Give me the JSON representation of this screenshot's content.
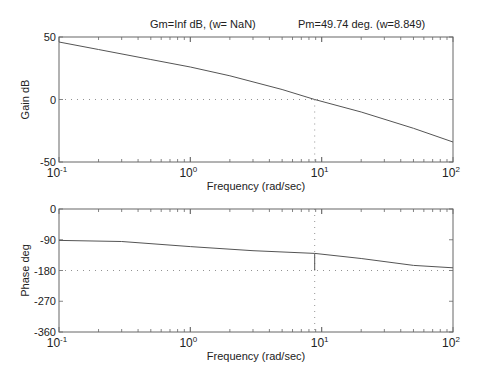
{
  "chart_data": [
    {
      "type": "line",
      "title": "Gm=Inf dB, (w= NaN)     Pm=49.74 deg. (w=8.849)",
      "xlabel": "Frequency (rad/sec)",
      "ylabel": "Gain dB",
      "xscale": "log",
      "xlim": [
        0.1,
        100
      ],
      "ylim": [
        -50,
        50
      ],
      "yticks": [
        50,
        0,
        -50
      ],
      "ytick_labels": [
        "50",
        "0",
        "-50"
      ],
      "xtick_labels": [
        "10-1",
        "100",
        "101",
        "102"
      ],
      "grid": false,
      "reference_lines": {
        "y": 0,
        "x": 8.849
      },
      "x": [
        0.1,
        0.2,
        0.5,
        1,
        2,
        5,
        8.849,
        20,
        50,
        100
      ],
      "series": [
        {
          "name": "Gain",
          "values": [
            46,
            40,
            32,
            26,
            19,
            8,
            0,
            -10,
            -23,
            -34
          ]
        }
      ]
    },
    {
      "type": "line",
      "xlabel": "Frequency (rad/sec)",
      "ylabel": "Phase deg",
      "xscale": "log",
      "xlim": [
        0.1,
        100
      ],
      "ylim": [
        -360,
        0
      ],
      "yticks": [
        0,
        -90,
        -180,
        -270,
        -360
      ],
      "ytick_labels": [
        "0",
        "-90",
        "-180",
        "-270",
        "-360"
      ],
      "xtick_labels": [
        "10-1",
        "100",
        "101",
        "102"
      ],
      "grid": false,
      "reference_lines": {
        "y": -180,
        "x": 8.849
      },
      "margin_marker": {
        "x": 8.849,
        "from": -180,
        "to": -130.26
      },
      "x": [
        0.1,
        0.3,
        1,
        3,
        8.849,
        20,
        50,
        100
      ],
      "series": [
        {
          "name": "Phase",
          "values": [
            -92,
            -95,
            -110,
            -122,
            -130,
            -145,
            -165,
            -172
          ]
        }
      ]
    }
  ],
  "figure": {
    "title_gm": "Gm=Inf dB, (w= NaN)",
    "title_pm": "Pm=49.74 deg. (w=8.849)",
    "top": {
      "ylabel": "Gain dB",
      "xlabel": "Frequency (rad/sec)",
      "yt": [
        "50",
        "0",
        "-50"
      ]
    },
    "bottom": {
      "ylabel": "Phase deg",
      "xlabel": "Frequency (rad/sec)",
      "yt": [
        "0",
        "-90",
        "-180",
        "-270",
        "-360"
      ]
    },
    "xt_base": "10",
    "xt_exp": [
      "-1",
      "0",
      "1",
      "2"
    ],
    "line_color": "#555555",
    "axis_color": "#666666"
  }
}
